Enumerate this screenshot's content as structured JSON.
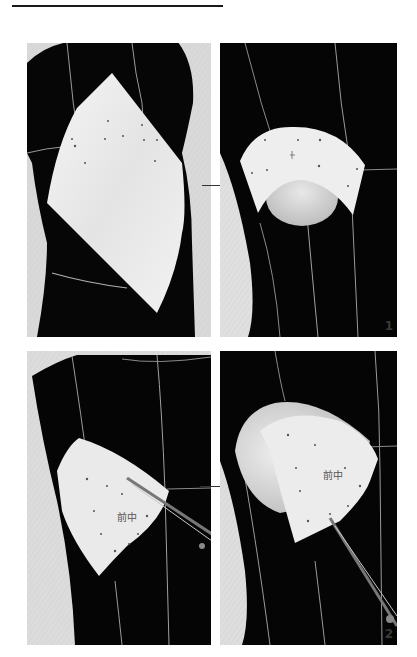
{
  "page": {
    "background": "#ffffff",
    "rule_color": "#1a1a1a"
  },
  "panels": [
    {
      "id": "p1",
      "description": "Large sheet of muslin pinned over bust of black dress form",
      "step_label": ""
    },
    {
      "id": "p2",
      "description": "Muslin trimmed into cup shape over bust with pin marks",
      "step_label": "1"
    },
    {
      "id": "p3",
      "description": "Scissors trimming muslin piece marked 前中 on dress form",
      "step_label": ""
    },
    {
      "id": "p4",
      "description": "Clipping seam allowance of muslin cup marked 前中 with scissors",
      "step_label": "2"
    }
  ],
  "annotations": {
    "muslin_marking": "前中",
    "step_1": "1",
    "step_2": "2"
  },
  "colors": {
    "dress_form": "#050505",
    "style_tape": "#b8b8b8",
    "muslin": "#ececec",
    "backdrop": "#d6d6d6",
    "label": "#3a3a3a"
  }
}
